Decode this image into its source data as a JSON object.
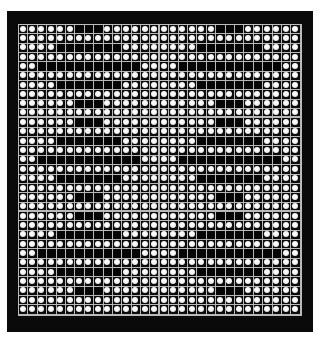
{
  "panel": {
    "columns": 30,
    "rows": 31,
    "colors": {
      "frame": "#0a0a0a",
      "grid_line": "#b8b8b8",
      "lit_dot": "#ffffff",
      "unlit_cell": "#050505"
    },
    "half_width": 15,
    "patterns": {
      "A": [
        6,
        7,
        8
      ],
      "B": [
        4,
        5,
        6,
        7,
        8,
        9,
        10
      ],
      "C": [
        2,
        3,
        4,
        5,
        6,
        7,
        8,
        9,
        10,
        11,
        12
      ]
    },
    "row_types": [
      "A",
      null,
      "B",
      null,
      "C",
      null,
      "B",
      null,
      "A",
      null,
      "A",
      null,
      "B",
      null,
      "C",
      null,
      "B",
      null,
      "A",
      null,
      "A",
      null,
      "B",
      null,
      "C",
      null,
      "B",
      null,
      "A",
      null,
      null
    ]
  }
}
